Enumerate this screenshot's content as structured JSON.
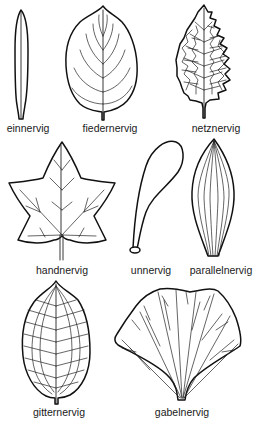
{
  "diagram": {
    "type": "leaf-venation-types",
    "leaves": [
      {
        "id": "einnervig",
        "label": "einnervig",
        "row": 1,
        "col": 1
      },
      {
        "id": "fiedernervig",
        "label": "fiedernervig",
        "row": 1,
        "col": 2
      },
      {
        "id": "netznervig",
        "label": "netznervig",
        "row": 1,
        "col": 3
      },
      {
        "id": "handnervig",
        "label": "handnervig",
        "row": 2,
        "col": 1
      },
      {
        "id": "unnervig",
        "label": "unnervig",
        "row": 2,
        "col": 2
      },
      {
        "id": "parallelnervig",
        "label": "parallelnervig",
        "row": 2,
        "col": 3
      },
      {
        "id": "gitternervig",
        "label": "gitternervig",
        "row": 3,
        "col": 1
      },
      {
        "id": "gabelnervig",
        "label": "gabelnervig",
        "row": 3,
        "col": 2
      }
    ]
  },
  "colors": {
    "background": "#ffffff",
    "line": "#111111"
  }
}
